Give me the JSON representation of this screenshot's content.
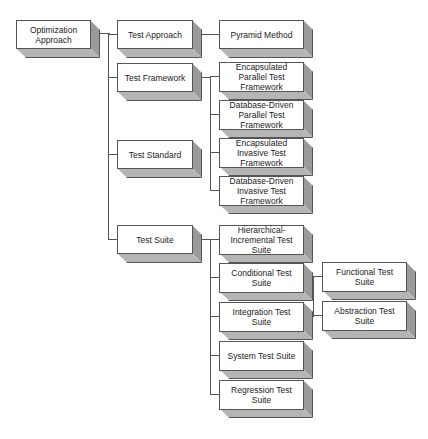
{
  "diagram": {
    "root": {
      "label": "Optimization Approach"
    },
    "level1": [
      {
        "label": "Test Approach"
      },
      {
        "label": "Test Framework"
      },
      {
        "label": "Test Standard"
      },
      {
        "label": "Test Suite"
      }
    ],
    "approach_children": [
      {
        "label": "Pyramid Method"
      }
    ],
    "framework_children": [
      {
        "label": "Encapsulated Parallel Test Framework"
      },
      {
        "label": "Database-Driven Parallel Test Framework"
      },
      {
        "label": "Encapsulated Invasive Test Framework"
      },
      {
        "label": "Database-Driven Invasive Test Framework"
      }
    ],
    "suite_children": [
      {
        "label": "Hierarchical-Incremental Test Suite"
      },
      {
        "label": "Conditional Test Suite"
      },
      {
        "label": "Integration Test Suite"
      },
      {
        "label": "System Test Suite"
      },
      {
        "label": "Regression Test Suite"
      }
    ],
    "integration_children": [
      {
        "label": "Functional Test Suite"
      },
      {
        "label": "Abstraction Test Suite"
      }
    ]
  }
}
